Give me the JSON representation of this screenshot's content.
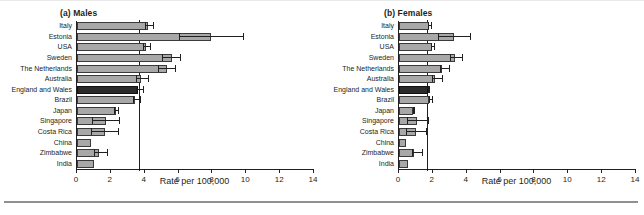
{
  "figure": {
    "separator": "bottom-rule"
  },
  "chart_data": [
    {
      "type": "bar",
      "orientation": "horizontal",
      "title": "(a) Males",
      "xlabel": "Rate per 100,000",
      "ylabel": "",
      "xlim": [
        0,
        14
      ],
      "xticks": [
        0,
        2,
        4,
        6,
        8,
        10,
        12,
        14
      ],
      "xticklabels": [
        "0",
        "2",
        "4",
        "6",
        "8",
        "10",
        "12",
        "14"
      ],
      "grid": false,
      "legend": "none",
      "reference_line": 3.7,
      "highlight_category": "England and Wales",
      "categories": [
        "Italy",
        "Estonia",
        "USA",
        "Sweden",
        "The Netherlands",
        "Australia",
        "England and Wales",
        "Brazil",
        "Japan",
        "Singapore",
        "Costa Rica",
        "China",
        "Zimbabwe",
        "India"
      ],
      "values": [
        4.2,
        7.9,
        4.1,
        5.6,
        5.3,
        3.8,
        3.6,
        3.4,
        2.3,
        1.7,
        1.65,
        0.8,
        1.3,
        1.0
      ],
      "ci_low": [
        4.0,
        6.0,
        3.9,
        5.0,
        4.8,
        3.5,
        3.5,
        3.3,
        2.2,
        0.9,
        0.8,
        0.8,
        1.0,
        1.0
      ],
      "ci_high": [
        4.5,
        9.8,
        4.3,
        6.1,
        5.8,
        4.2,
        3.9,
        3.7,
        2.4,
        2.5,
        2.45,
        0.8,
        1.8,
        1.0
      ]
    },
    {
      "type": "bar",
      "orientation": "horizontal",
      "title": "(b) Females",
      "xlabel": "Rate per 100,000",
      "ylabel": "",
      "xlim": [
        0,
        14
      ],
      "xticks": [
        0,
        2,
        4,
        6,
        8,
        10,
        12,
        14
      ],
      "xticklabels": [
        "0",
        "2",
        "4",
        "6",
        "8",
        "10",
        "12",
        "14"
      ],
      "grid": false,
      "legend": "none",
      "reference_line": 1.7,
      "highlight_category": "England and Wales",
      "categories": [
        "Italy",
        "Estonia",
        "USA",
        "Sweden",
        "The Netherlands",
        "Australia",
        "England and Wales",
        "Brazil",
        "Japan",
        "Singapore",
        "Costa Rica",
        "China",
        "Zimbabwe",
        "India"
      ],
      "values": [
        1.75,
        3.25,
        1.95,
        3.3,
        2.55,
        2.1,
        1.7,
        1.8,
        0.85,
        1.05,
        1.0,
        0.4,
        0.9,
        0.55
      ],
      "ci_low": [
        1.7,
        2.3,
        1.9,
        3.0,
        2.4,
        1.95,
        1.7,
        1.75,
        0.85,
        0.5,
        0.4,
        0.4,
        0.75,
        0.55
      ],
      "ci_high": [
        1.9,
        4.2,
        2.05,
        3.75,
        2.95,
        2.55,
        1.8,
        1.95,
        0.9,
        1.7,
        1.6,
        0.4,
        1.35,
        0.55
      ]
    }
  ],
  "colors": {
    "bar_fill": "#a8a8a8",
    "bar_edge": "#3a3a3a",
    "bar_highlight": "#2b2b2b",
    "axis": "#231f20",
    "rule": "#8e9094"
  }
}
